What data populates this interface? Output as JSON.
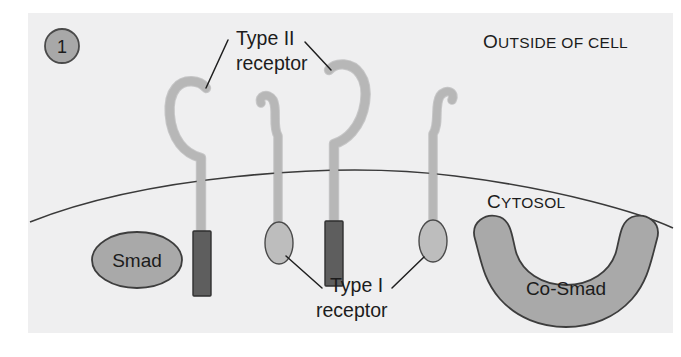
{
  "figure": {
    "step_number": "1",
    "panel_background": "#efeff0",
    "page_background": "#ffffff"
  },
  "compartments": [
    {
      "id": "outside",
      "lead_char": "O",
      "rest_text": "UTSIDE OF CELL",
      "full_text": "OUTSIDE OF CELL",
      "x": 483,
      "y": 48
    },
    {
      "id": "cytosol",
      "lead_char": "C",
      "rest_text": "YTOSOL",
      "full_text": "CYTOSOL",
      "x": 487,
      "y": 208
    }
  ],
  "callouts": [
    {
      "id": "type-ii",
      "line1": "Type II",
      "line2": "receptor",
      "line1_x": 236,
      "line1_y": 45,
      "line2_x": 236,
      "line2_y": 70
    },
    {
      "id": "type-i",
      "line1": "Type I",
      "line2": "receptor",
      "line1_x": 330,
      "line1_y": 292,
      "line2_x": 316,
      "line2_y": 317
    }
  ],
  "proteins": [
    {
      "id": "smad",
      "label": "Smad",
      "shape": "ellipse",
      "fill": "#a9a9a9",
      "stroke": "#3d3d3d",
      "cx": 137,
      "cy": 260,
      "rx": 45,
      "ry": 28,
      "label_x": 137,
      "label_y": 267
    },
    {
      "id": "co-smad",
      "label": "Co-Smad",
      "shape": "horseshoe",
      "fill": "#a9a9a9",
      "stroke": "#3d3d3d",
      "label_x": 566,
      "label_y": 288
    }
  ],
  "receptors": [
    {
      "id": "type-ii-left",
      "kind": "Type II receptor",
      "orientation": "hook-left",
      "stem_fill": "#b4b4b4",
      "domain_fill": "#5e5e5e",
      "domain_shape": "rectangle"
    },
    {
      "id": "type-i-left",
      "kind": "Type I receptor",
      "orientation": "hook-left",
      "stem_fill": "#b4b4b4",
      "domain_fill": "#bdbdbd",
      "domain_shape": "ellipse"
    },
    {
      "id": "type-ii-right",
      "kind": "Type II receptor",
      "orientation": "hook-right",
      "stem_fill": "#b4b4b4",
      "domain_fill": "#5e5e5e",
      "domain_shape": "rectangle"
    },
    {
      "id": "type-i-right",
      "kind": "Type I receptor",
      "orientation": "hook-right",
      "stem_fill": "#b4b4b4",
      "domain_fill": "#bdbdbd",
      "domain_shape": "ellipse"
    }
  ],
  "colors": {
    "panel": "#efeff0",
    "membrane_line": "#3a3a3a",
    "receptor_stem": "#b4b4b4",
    "receptor_stem_outline": "#6e6e6e",
    "type_ii_domain": "#5e5e5e",
    "type_i_domain": "#bdbdbd",
    "protein_fill": "#a9a9a9",
    "protein_outline": "#3d3d3d",
    "text": "#1c1c1c",
    "step_circle_fill": "#a8a8a8",
    "step_circle_outline": "#4a4a4a"
  }
}
